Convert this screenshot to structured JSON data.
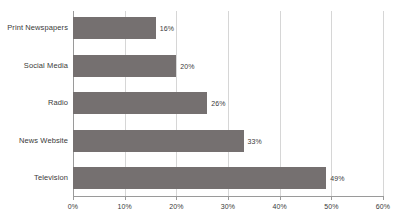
{
  "chart_data": {
    "type": "bar",
    "orientation": "horizontal",
    "title": "",
    "xlabel": "",
    "ylabel": "",
    "categories": [
      "Print Newspapers",
      "Social Media",
      "Radio",
      "News Website",
      "Television"
    ],
    "values": [
      16,
      20,
      26,
      33,
      49
    ],
    "value_labels": [
      "16%",
      "20%",
      "26%",
      "33%",
      "49%"
    ],
    "xlim": [
      0,
      60
    ],
    "xticks": [
      0,
      10,
      20,
      30,
      40,
      50,
      60
    ],
    "xtick_labels": [
      "0%",
      "10%",
      "20%",
      "30%",
      "40%",
      "50%",
      "60%"
    ],
    "grid": true,
    "grid_axis": "x",
    "legend": false,
    "bar_color": "#757070",
    "grid_color": "#d6d6d6",
    "axis_color": "#9a9a9a",
    "background_color": "#ffffff",
    "text_color": "#3a3a3a"
  }
}
